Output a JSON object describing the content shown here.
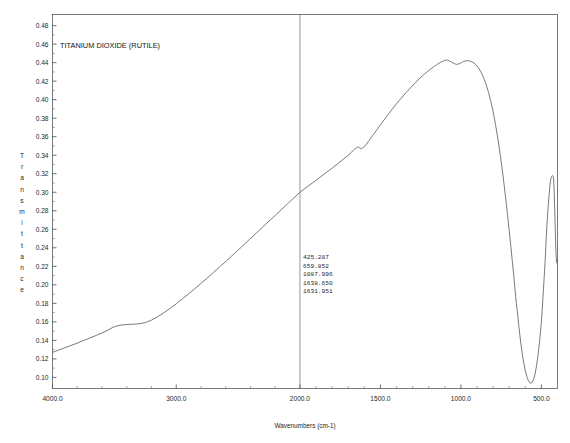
{
  "chart_data": {
    "type": "line",
    "title": "TITANIUM DIOXIDE (RUTILE)",
    "xlabel": "Wavenumbers (cm-1)",
    "ylabel": "Transmittance",
    "ylabel_letters": [
      "T",
      "r",
      "a",
      "n",
      "s",
      "m",
      "i",
      "t",
      "t",
      "a",
      "n",
      "c",
      "e"
    ],
    "grid": false,
    "legend": "none",
    "x_axis": {
      "segments": [
        {
          "from": 4000.0,
          "to": 2000.0,
          "tick_step": 1000.0
        },
        {
          "from": 2000.0,
          "to": 400.0,
          "tick_step": 500.0
        }
      ],
      "tick_labels": [
        "4000.0",
        "3000.0",
        "2000.0",
        "1500.0",
        "1000.0",
        "500.0"
      ],
      "tick_values": [
        4000.0,
        3000.0,
        2000.0,
        1500.0,
        1000.0,
        500.0
      ],
      "direction": "descending",
      "break_at": 2000.0
    },
    "y_axis": {
      "tick_labels": [
        "0.48",
        "0.46",
        "0.44",
        "0.42",
        "0.40",
        "0.38",
        "0.36",
        "0.34",
        "0.32",
        "0.30",
        "0.28",
        "0.26",
        "0.24",
        "0.22",
        "0.20",
        "0.18",
        "0.16",
        "0.14",
        "0.12",
        "0.10"
      ],
      "tick_values": [
        0.48,
        0.46,
        0.44,
        0.42,
        0.4,
        0.38,
        0.36,
        0.34,
        0.32,
        0.3,
        0.28,
        0.26,
        0.24,
        0.22,
        0.2,
        0.18,
        0.16,
        0.14,
        0.12,
        0.1
      ],
      "ylim": [
        0.088,
        0.492
      ]
    },
    "peak_table": {
      "values": [
        "425.287",
        "659.852",
        "1087.996",
        "1638.650",
        "1631.951"
      ]
    },
    "x": [
      4000.0,
      3950.0,
      3900.0,
      3850.0,
      3800.0,
      3750.0,
      3700.0,
      3650.0,
      3600.0,
      3550.0,
      3520.0,
      3490.0,
      3460.0,
      3430.0,
      3400.0,
      3370.0,
      3340.0,
      3310.0,
      3280.0,
      3250.0,
      3200.0,
      3150.0,
      3100.0,
      3050.0,
      3000.0,
      2950.0,
      2900.0,
      2850.0,
      2800.0,
      2750.0,
      2700.0,
      2650.0,
      2600.0,
      2550.0,
      2500.0,
      2450.0,
      2400.0,
      2350.0,
      2300.0,
      2250.0,
      2200.0,
      2150.0,
      2100.0,
      2050.0,
      2000.0,
      1950.0,
      1900.0,
      1850.0,
      1800.0,
      1760.0,
      1720.0,
      1700.0,
      1680.0,
      1665.0,
      1655.0,
      1645.0,
      1638.65,
      1634.0,
      1631.95,
      1628.0,
      1620.0,
      1610.0,
      1595.0,
      1575.0,
      1550.0,
      1520.0,
      1490.0,
      1460.0,
      1430.0,
      1400.0,
      1370.0,
      1340.0,
      1310.0,
      1280.0,
      1255.0,
      1230.0,
      1205.0,
      1185.0,
      1165.0,
      1150.0,
      1135.0,
      1120.0,
      1110.0,
      1100.0,
      1092.0,
      1087.996,
      1082.0,
      1075.0,
      1065.0,
      1055.0,
      1045.0,
      1035.0,
      1025.0,
      1015.0,
      1005.0,
      995.0,
      985.0,
      975.0,
      965.0,
      950.0,
      935.0,
      920.0,
      905.0,
      890.0,
      875.0,
      860.0,
      845.0,
      830.0,
      815.0,
      800.0,
      785.0,
      770.0,
      755.0,
      740.0,
      725.0,
      710.0,
      700.0,
      690.0,
      680.0,
      672.0,
      665.0,
      659.852,
      655.0,
      648.0,
      640.0,
      632.0,
      624.0,
      616.0,
      608.0,
      600.0,
      590.0,
      580.0,
      570.0,
      560.0,
      550.0,
      540.0,
      530.0,
      520.0,
      510.0,
      500.0,
      492.0,
      484.0,
      476.0,
      470.0,
      464.0,
      458.0,
      452.0,
      447.0,
      443.0,
      439.0,
      436.0,
      433.0,
      430.0,
      427.5,
      425.287,
      423.0,
      420.5,
      418.0,
      415.0,
      412.0,
      409.0,
      406.0,
      403.0,
      400.0
    ],
    "y": [
      0.127,
      0.1295,
      0.132,
      0.1345,
      0.137,
      0.1398,
      0.1425,
      0.1452,
      0.148,
      0.1512,
      0.1535,
      0.1552,
      0.1562,
      0.1568,
      0.1571,
      0.1573,
      0.1575,
      0.1578,
      0.1583,
      0.1592,
      0.1618,
      0.1655,
      0.1698,
      0.1745,
      0.1795,
      0.1848,
      0.1902,
      0.1958,
      0.2015,
      0.2072,
      0.2132,
      0.2192,
      0.2252,
      0.2313,
      0.2375,
      0.2437,
      0.25,
      0.2562,
      0.2625,
      0.2688,
      0.275,
      0.2812,
      0.2875,
      0.2937,
      0.3,
      0.3065,
      0.313,
      0.3195,
      0.326,
      0.3315,
      0.3372,
      0.34,
      0.3432,
      0.3458,
      0.3472,
      0.3484,
      0.3489,
      0.3488,
      0.3484,
      0.3478,
      0.3472,
      0.3478,
      0.3502,
      0.3548,
      0.3608,
      0.368,
      0.3752,
      0.3822,
      0.389,
      0.3955,
      0.4018,
      0.4078,
      0.4135,
      0.4188,
      0.4232,
      0.4272,
      0.4308,
      0.4335,
      0.436,
      0.4378,
      0.4395,
      0.441,
      0.4418,
      0.4424,
      0.4427,
      0.4428,
      0.4427,
      0.4422,
      0.4413,
      0.4402,
      0.4392,
      0.4385,
      0.4382,
      0.4385,
      0.4392,
      0.4402,
      0.4412,
      0.4418,
      0.4421,
      0.442,
      0.4412,
      0.4398,
      0.4375,
      0.4342,
      0.4298,
      0.4242,
      0.4172,
      0.4088,
      0.3988,
      0.387,
      0.3732,
      0.3575,
      0.3398,
      0.32,
      0.2982,
      0.2748,
      0.2585,
      0.2415,
      0.2242,
      0.2102,
      0.1968,
      0.1872,
      0.1798,
      0.1685,
      0.1552,
      0.1428,
      0.1318,
      0.1222,
      0.114,
      0.1072,
      0.1008,
      0.0962,
      0.0938,
      0.0942,
      0.0972,
      0.1032,
      0.1125,
      0.1252,
      0.1412,
      0.1602,
      0.1815,
      0.2045,
      0.2282,
      0.2518,
      0.269,
      0.2845,
      0.2975,
      0.3072,
      0.3128,
      0.3158,
      0.3172,
      0.3178,
      0.318,
      0.3175,
      0.316,
      0.3108,
      0.3005,
      0.2855,
      0.2672,
      0.2482,
      0.2328,
      0.2248,
      0.2232,
      0.2268,
      0.2342,
      0.2452,
      0.2598,
      0.278,
      0.2975
    ]
  }
}
